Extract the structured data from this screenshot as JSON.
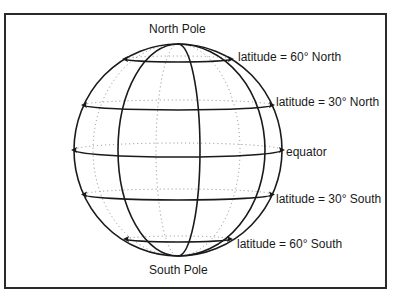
{
  "diagram": {
    "labels": {
      "north_pole": "North Pole",
      "south_pole": "South Pole",
      "lat_60_north": "latitude = 60° North",
      "lat_30_north": "latitude = 30° North",
      "equator": "equator",
      "lat_30_south": "latitude = 30° South",
      "lat_60_south": "latitude = 60° South"
    },
    "colors": {
      "line": "#1a1a1a",
      "hidden_line": "#8a8a8a",
      "frame": "#2a2a2a",
      "background": "#ffffff"
    },
    "globe": {
      "cx": 178,
      "cy": 150,
      "rx": 104,
      "ry": 106,
      "parallels": [
        {
          "name": "lat_60_north",
          "y_front": 62,
          "y_back": 56,
          "half_width": 53
        },
        {
          "name": "lat_30_north",
          "y_front": 110,
          "y_back": 100,
          "half_width": 94
        },
        {
          "name": "equator",
          "y_front": 157,
          "y_back": 143,
          "half_width": 104
        },
        {
          "name": "lat_30_south",
          "y_front": 200,
          "y_back": 189,
          "half_width": 94
        },
        {
          "name": "lat_60_south",
          "y_front": 242,
          "y_back": 236,
          "half_width": 52
        }
      ],
      "front_meridians_equator_x": [
        118,
        200,
        265
      ],
      "back_meridians_equator_x": [
        93,
        156,
        240
      ]
    }
  }
}
